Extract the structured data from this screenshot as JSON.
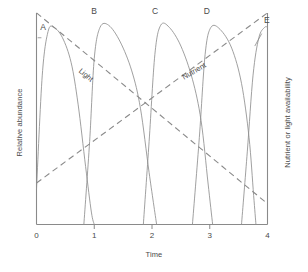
{
  "chart_data": {
    "type": "line",
    "title": "",
    "xlabel": "Time",
    "ylabel": "Relative abundance",
    "ylabel_right": "Nutrient or light availability",
    "xlim": [
      0,
      4
    ],
    "ylim": [
      0,
      1
    ],
    "grid": false,
    "legend": "inline-labels",
    "xticks": [
      "0",
      "1",
      "2",
      "3",
      "4"
    ],
    "xtick_values": [
      0,
      1,
      2,
      3,
      4
    ],
    "yticks": [],
    "series": [
      {
        "name": "A",
        "kind": "abundance-curve",
        "label": "A",
        "peak_x": 0.25,
        "start_x": 0.0,
        "end_x": 1.0,
        "peak_y": 0.93,
        "x": [
          0.0,
          0.1,
          0.2,
          0.3,
          0.45,
          0.6,
          0.72,
          0.85,
          0.95,
          1.0
        ],
        "y": [
          0.17,
          0.72,
          0.93,
          0.95,
          0.9,
          0.78,
          0.58,
          0.28,
          0.06,
          0.0
        ]
      },
      {
        "name": "B",
        "kind": "abundance-curve",
        "label": "B",
        "peak_x": 1.15,
        "start_x": 0.82,
        "end_x": 2.08,
        "peak_y": 0.96,
        "x": [
          0.82,
          0.92,
          1.0,
          1.1,
          1.25,
          1.45,
          1.65,
          1.8,
          1.95,
          2.08
        ],
        "y": [
          0.0,
          0.4,
          0.8,
          0.95,
          0.96,
          0.88,
          0.74,
          0.56,
          0.25,
          0.0
        ]
      },
      {
        "name": "C",
        "kind": "abundance-curve",
        "label": "C",
        "peak_x": 2.15,
        "start_x": 1.85,
        "end_x": 3.05,
        "peak_y": 0.96,
        "x": [
          1.85,
          1.95,
          2.05,
          2.15,
          2.3,
          2.5,
          2.7,
          2.85,
          2.97,
          3.05
        ],
        "y": [
          0.0,
          0.4,
          0.82,
          0.96,
          0.95,
          0.86,
          0.7,
          0.5,
          0.2,
          0.0
        ]
      },
      {
        "name": "D",
        "kind": "abundance-curve",
        "label": "D",
        "peak_x": 3.0,
        "start_x": 2.7,
        "end_x": 3.8,
        "peak_y": 0.95,
        "x": [
          2.7,
          2.82,
          2.92,
          3.02,
          3.18,
          3.38,
          3.55,
          3.68,
          3.76,
          3.8
        ],
        "y": [
          0.0,
          0.42,
          0.82,
          0.95,
          0.94,
          0.85,
          0.68,
          0.42,
          0.14,
          0.0
        ]
      },
      {
        "name": "E",
        "kind": "abundance-curve",
        "label": "E",
        "peak_x": 3.95,
        "start_x": 3.55,
        "end_x": 4.0,
        "peak_y": 0.95,
        "x": [
          3.55,
          3.65,
          3.75,
          3.85,
          3.95,
          4.0
        ],
        "y": [
          0.0,
          0.35,
          0.72,
          0.9,
          0.95,
          0.95
        ]
      },
      {
        "name": "Light",
        "kind": "resource-line",
        "style": "dashed",
        "label": "Light",
        "direction": "decreasing",
        "x": [
          0.0,
          4.0
        ],
        "y": [
          1.02,
          0.1
        ]
      },
      {
        "name": "Nutrient",
        "kind": "resource-line",
        "style": "dashed",
        "label": "Nutrient",
        "direction": "increasing",
        "x": [
          0.0,
          4.0
        ],
        "y": [
          0.2,
          1.02
        ]
      }
    ],
    "annotations": [
      {
        "text": "A",
        "x": 0.1,
        "y": 0.92,
        "leader": true
      },
      {
        "text": "B",
        "x": 1.0,
        "y": 0.99,
        "leader": true
      },
      {
        "text": "C",
        "x": 2.05,
        "y": 0.99,
        "leader": true
      },
      {
        "text": "D",
        "x": 2.95,
        "y": 0.99,
        "leader": true
      },
      {
        "text": "E",
        "x": 3.92,
        "y": 0.95,
        "leader": true
      },
      {
        "text": "Light",
        "x": 0.85,
        "y": 0.72,
        "rotation": 40
      },
      {
        "text": "Nutrient",
        "x": 2.72,
        "y": 0.74,
        "rotation": -30
      }
    ],
    "colors": {
      "axis": "#8a8a8a",
      "curve": "#8f8f8f",
      "dashed": "#8a8a8a",
      "text": "#4a4a4a",
      "background": "#ffffff"
    }
  }
}
